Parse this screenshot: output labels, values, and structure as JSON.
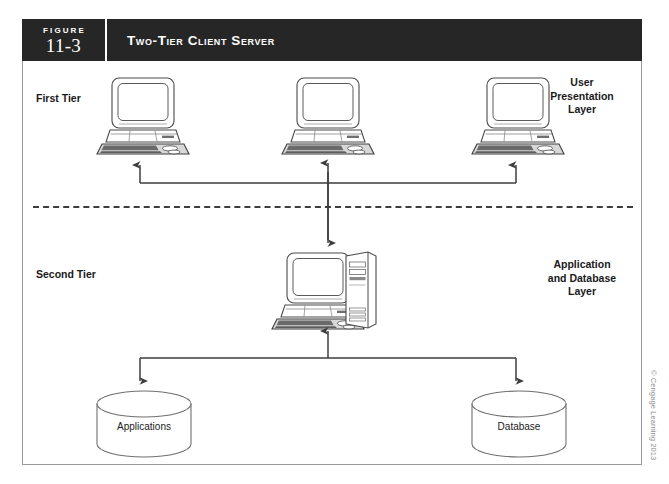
{
  "figure": {
    "label_word": "FIGURE",
    "number": "11-3",
    "title": "Two-Tier Client Server"
  },
  "tiers": {
    "first": "First Tier",
    "second": "Second Tier"
  },
  "layers": {
    "user": "User\nPresentation\nLayer",
    "user_lines": [
      "User",
      "Presentation",
      "Layer"
    ],
    "application": "Application\nand Database\nLayer",
    "application_lines": [
      "Application",
      "and Database",
      "Layer"
    ]
  },
  "nodes": {
    "client_1": "client-workstation",
    "client_2": "client-workstation",
    "client_3": "client-workstation",
    "server": "server-workstation",
    "store_applications": "Applications",
    "store_database": "Database"
  },
  "copyright": "© Cengage Learning 2013",
  "colors": {
    "header_bg": "#262626",
    "header_text": "#ffffff",
    "frame_border": "#9a9a9a",
    "line": "#3d3d3d",
    "device_outline": "#4a4a4a",
    "device_fill": "#ffffff",
    "copyright_text": "#8e8e8e"
  }
}
